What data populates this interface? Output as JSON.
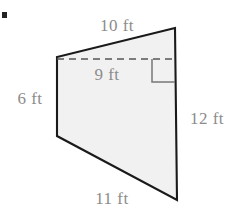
{
  "figure": {
    "bullet_marker": "problem-bullet",
    "shape": {
      "name": "quadrilateral",
      "fill_color": "#f1f1f1",
      "stroke_color": "#1a1a1a",
      "vertices": [
        {
          "name": "top-right",
          "x": 175,
          "y": 28
        },
        {
          "name": "top-left",
          "x": 57,
          "y": 57
        },
        {
          "name": "bottom-left",
          "x": 57,
          "y": 136
        },
        {
          "name": "bottom-right",
          "x": 177,
          "y": 200
        }
      ]
    },
    "altitude": {
      "name": "dashed-height-segment",
      "style": "dashed",
      "color": "#555555",
      "x1": 57,
      "y1": 59,
      "x2": 176,
      "y2": 59
    },
    "right_angle_marker": {
      "name": "right-angle-square",
      "x": 152,
      "y": 59,
      "size": 23,
      "color": "#777777"
    },
    "labels": {
      "top": {
        "text": "10 ft",
        "value": 10,
        "unit": "ft",
        "x": 117,
        "y": 25
      },
      "height": {
        "text": "9 ft",
        "value": 9,
        "unit": "ft",
        "x": 107,
        "y": 74
      },
      "left": {
        "text": "6 ft",
        "value": 6,
        "unit": "ft",
        "x": 30,
        "y": 98
      },
      "right": {
        "text": "12 ft",
        "value": 12,
        "unit": "ft",
        "x": 207,
        "y": 118
      },
      "bottom": {
        "text": "11 ft",
        "value": 11,
        "unit": "ft",
        "x": 112,
        "y": 198
      }
    },
    "label_color": "#8c8c8c"
  }
}
